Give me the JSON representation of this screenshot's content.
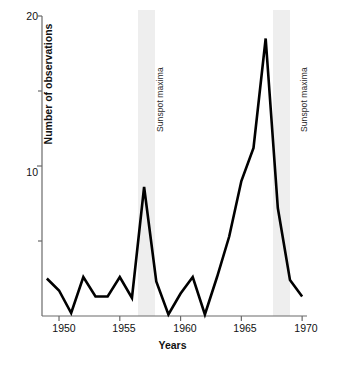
{
  "chart_data": {
    "type": "line",
    "title": "",
    "xlabel": "Years",
    "ylabel": "Number of observations",
    "xlim": [
      1948.6,
      1970.4
    ],
    "ylim": [
      0,
      20
    ],
    "grid": false,
    "legend": "none",
    "x_ticks": [
      1950,
      1955,
      1960,
      1965,
      1970
    ],
    "x_tick_labels": [
      "1950",
      "1955",
      "1960",
      "1965",
      "1970"
    ],
    "y_ticks": [
      0,
      5,
      10,
      15,
      20
    ],
    "y_tick_labels": [
      "",
      "",
      "10",
      "",
      "20"
    ],
    "y_major_labels": [
      "10",
      "20"
    ],
    "series": [
      {
        "name": "Number of observations",
        "color": "#000000",
        "x": [
          1949,
          1950,
          1951,
          1952,
          1953,
          1954,
          1955,
          1956,
          1957,
          1958,
          1959,
          1960,
          1961,
          1962,
          1963,
          1964,
          1965,
          1966,
          1967,
          1968,
          1969,
          1970
        ],
        "values": [
          2.5,
          1.7,
          0.2,
          2.6,
          1.3,
          1.3,
          2.6,
          1.2,
          8.6,
          2.3,
          0.1,
          1.5,
          2.6,
          0.1,
          2.6,
          5.3,
          9.0,
          11.2,
          18.5,
          7.2,
          2.4,
          1.3
        ]
      }
    ],
    "annotations": [
      {
        "label": "Sunspot maxima",
        "type": "vertical-band",
        "x_start": 1956.5,
        "x_end": 1957.9
      },
      {
        "label": "Sunspot maxima",
        "type": "vertical-band",
        "x_start": 1967.6,
        "x_end": 1969.0
      }
    ],
    "band_color": "#eeeeee"
  }
}
